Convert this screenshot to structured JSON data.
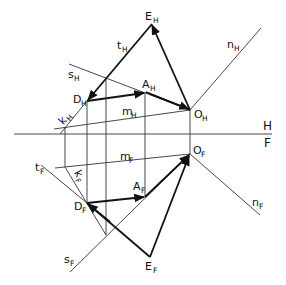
{
  "diagram": {
    "type": "descriptive-geometry-projection",
    "axis": {
      "top_label": "H",
      "bottom_label": "F"
    },
    "labels": {
      "E_H": {
        "main": "E",
        "sub": "H"
      },
      "t_H": {
        "main": "t",
        "sub": "H"
      },
      "n_H": {
        "main": "n",
        "sub": "H"
      },
      "s_H": {
        "main": "s",
        "sub": "H"
      },
      "A_H": {
        "main": "A",
        "sub": "H"
      },
      "D_H": {
        "main": "D",
        "sub": "H"
      },
      "m_H": {
        "main": "m",
        "sub": "H"
      },
      "k_H": {
        "main": "k",
        "sub": "H"
      },
      "O_H": {
        "main": "O",
        "sub": "H"
      },
      "O_F": {
        "main": "O",
        "sub": "F"
      },
      "m_F": {
        "main": "m",
        "sub": "F"
      },
      "t_F": {
        "main": "t",
        "sub": "F"
      },
      "k_F": {
        "main": "k",
        "sub": "F"
      },
      "A_F": {
        "main": "A",
        "sub": "F"
      },
      "D_F": {
        "main": "D",
        "sub": "F"
      },
      "n_F": {
        "main": "n",
        "sub": "F"
      },
      "s_F": {
        "main": "s",
        "sub": "F"
      },
      "E_F": {
        "main": "E",
        "sub": "F"
      }
    },
    "colors": {
      "line": "#111111",
      "background": "#ffffff"
    }
  }
}
